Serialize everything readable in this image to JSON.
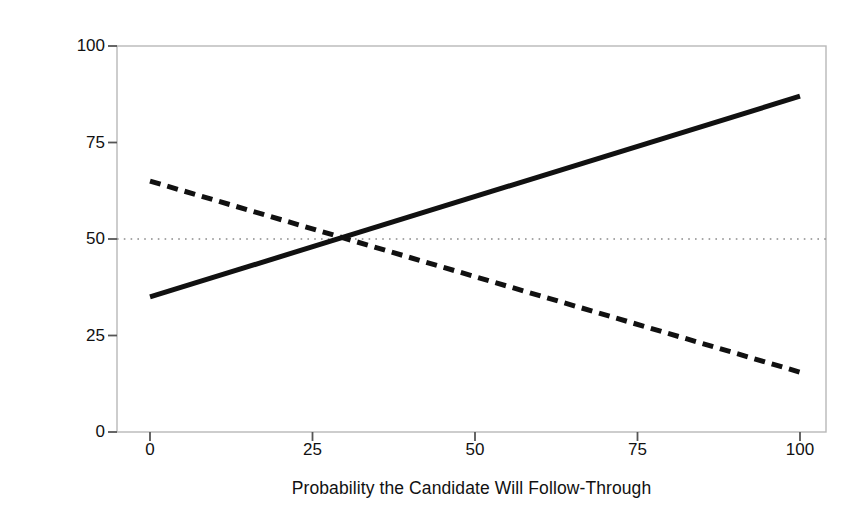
{
  "chart_data": {
    "type": "line",
    "title": "",
    "xlabel": "Probability the Candidate Will Follow-Through",
    "ylabel": "Percent of the Population Preferring Candidate",
    "xlim": [
      0,
      100
    ],
    "ylim": [
      0,
      100
    ],
    "xticks": [
      0,
      25,
      50,
      75,
      100
    ],
    "yticks": [
      0,
      25,
      50,
      75,
      100
    ],
    "xtick_labels": [
      "0",
      "25",
      "50",
      "75",
      "100"
    ],
    "ytick_labels": [
      "0",
      "25",
      "50",
      "75",
      "100"
    ],
    "grid": false,
    "legend": "none",
    "series": [
      {
        "name": "rising-candidate",
        "style": "solid",
        "color": "#111111",
        "width": 5,
        "x": [
          0,
          100
        ],
        "values": [
          35,
          87
        ]
      },
      {
        "name": "falling-candidate",
        "style": "dashed",
        "color": "#111111",
        "width": 5,
        "x": [
          0,
          100
        ],
        "values": [
          65,
          15.5
        ]
      }
    ],
    "reference_lines": [
      {
        "name": "fifty-percent-reference",
        "orientation": "horizontal",
        "value": 50,
        "style": "dotted",
        "color": "#8a8a8a"
      }
    ],
    "annotations": [
      {
        "name": "crossover-point",
        "x": 29,
        "y": 50,
        "label": ""
      }
    ],
    "frame_color": "#b8b8b8",
    "background": "#ffffff"
  }
}
